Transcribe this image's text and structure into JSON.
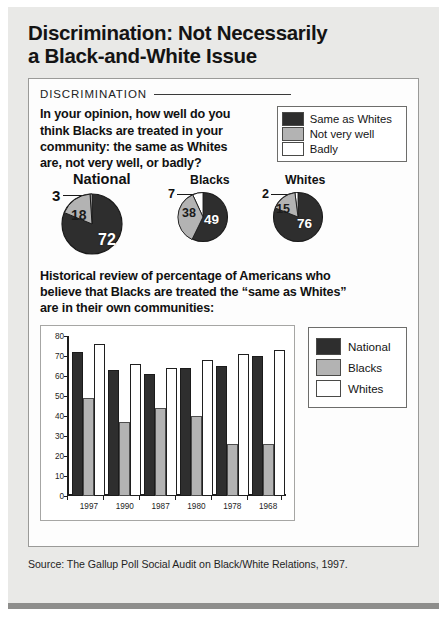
{
  "headline": {
    "line1": "Discrimination: Not Necessarily",
    "line2": "a Black-and-White Issue"
  },
  "card": {
    "kicker": "DISCRIMINATION",
    "question": {
      "line1": "In your opinion, how well do you",
      "line2": "think Blacks are treated in your",
      "line3": "community: the same as Whites",
      "line4": "are, not very well, or badly?"
    },
    "pie_legend": [
      {
        "label": "Same as Whites",
        "color": "#2e2e2e"
      },
      {
        "label": "Not very well",
        "color": "#b3b3b3"
      },
      {
        "label": "Badly",
        "color": "#ffffff"
      }
    ],
    "subhead": {
      "line1": "Historical review of percentage of Americans who",
      "line2": "believe that Blacks are treated the “same as Whites”",
      "line3": "are in their own communities:"
    }
  },
  "pie_charts": [
    {
      "title": "National",
      "same_as_whites": 72,
      "not_very_well": 18,
      "badly": 3,
      "labels": {
        "same": "72",
        "not_very": "18",
        "badly": "3"
      }
    },
    {
      "title": "Blacks",
      "same_as_whites": 49,
      "not_very_well": 38,
      "badly": 7,
      "labels": {
        "same": "49",
        "not_very": "38",
        "badly": "7"
      }
    },
    {
      "title": "Whites",
      "same_as_whites": 76,
      "not_very_well": 15,
      "badly": 2,
      "labels": {
        "same": "76",
        "not_very": "15",
        "badly": "2"
      }
    }
  ],
  "chart_data": {
    "type": "bar",
    "title": "Historical review of percentage of Americans who believe that Blacks are treated the “same as Whites” are in their own communities",
    "categories": [
      "1997",
      "1990",
      "1987",
      "1980",
      "1978",
      "1968"
    ],
    "series": [
      {
        "name": "National",
        "color": "#2e2e2e",
        "values": [
          72,
          63,
          61,
          64,
          65,
          70
        ]
      },
      {
        "name": "Blacks",
        "color": "#b3b3b3",
        "values": [
          49,
          37,
          44,
          40,
          26,
          26
        ]
      },
      {
        "name": "Whites",
        "color": "#ffffff",
        "values": [
          76,
          66,
          64,
          68,
          71,
          73
        ]
      }
    ],
    "xlabel": "",
    "ylabel": "",
    "ylim": [
      0,
      80
    ],
    "yticks": [
      0,
      10,
      20,
      30,
      40,
      50,
      60,
      70,
      80
    ],
    "grid": false,
    "legend_position": "right"
  },
  "bar_legend": [
    {
      "label": "National",
      "color": "#2e2e2e"
    },
    {
      "label": "Blacks",
      "color": "#b3b3b3"
    },
    {
      "label": "Whites",
      "color": "#ffffff"
    }
  ],
  "source": "Source: The Gallup Poll Social Audit on Black/White Relations, 1997."
}
